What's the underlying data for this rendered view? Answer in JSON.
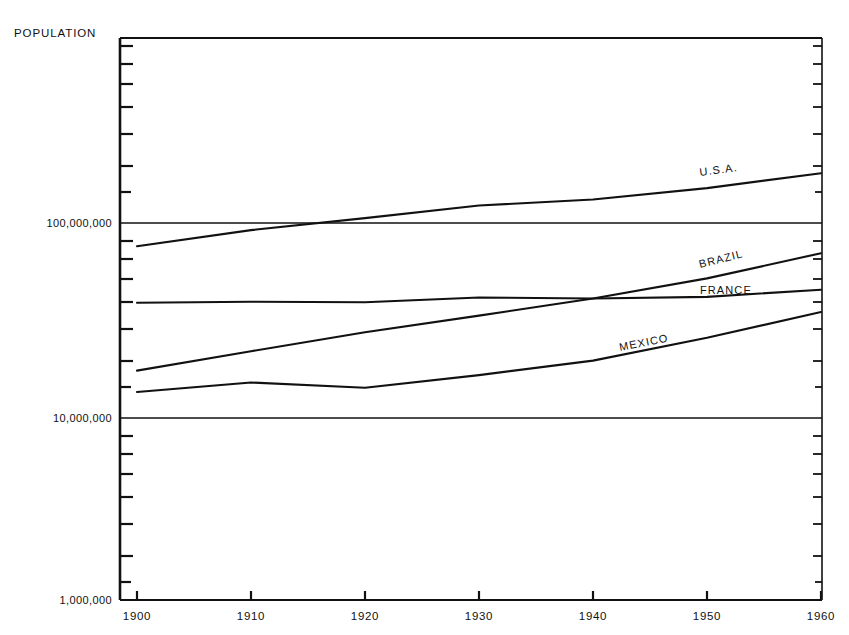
{
  "chart_data": {
    "type": "line",
    "title": "POPULATION",
    "xlabel": "",
    "ylabel": "POPULATION",
    "yscale": "log",
    "ylim": [
      1000000,
      250000000
    ],
    "xlim": [
      1897,
      1962
    ],
    "grid": true,
    "legend_position": "inline-labels",
    "x": [
      1900,
      1910,
      1920,
      1930,
      1940,
      1950,
      1960
    ],
    "xticklabels": [
      "1900",
      "1910",
      "1920",
      "1930",
      "1940",
      "1950",
      "1960"
    ],
    "yticks": [
      1000000,
      10000000,
      100000000
    ],
    "yticklabels": [
      "1,000,000",
      "10,000,000",
      "100,000,000"
    ],
    "series": [
      {
        "name": "U.S.A.",
        "label": "U.S.A.",
        "x": [
          1900,
          1910,
          1920,
          1930,
          1940,
          1950,
          1960
        ],
        "values": [
          76000000,
          92000000,
          106000000,
          123000000,
          132000000,
          151000000,
          180000000
        ]
      },
      {
        "name": "BRAZIL",
        "label": "BRAZIL",
        "x": [
          1900,
          1910,
          1920,
          1930,
          1940,
          1950,
          1960
        ],
        "values": [
          17500000,
          22000000,
          27500000,
          33500000,
          41000000,
          52000000,
          70000000
        ]
      },
      {
        "name": "FRANCE",
        "label": "FRANCE",
        "x": [
          1900,
          1910,
          1920,
          1930,
          1940,
          1950,
          1960
        ],
        "values": [
          39000000,
          39500000,
          39200000,
          41500000,
          41000000,
          41800000,
          45500000
        ]
      },
      {
        "name": "MEXICO",
        "label": "MEXICO",
        "x": [
          1900,
          1910,
          1920,
          1930,
          1940,
          1950,
          1960
        ],
        "values": [
          13600000,
          15200000,
          14300000,
          16600000,
          19700000,
          25800000,
          34900000
        ]
      }
    ]
  },
  "axes": {
    "y_title": "POPULATION",
    "y_labels": {
      "top": "100,000,000",
      "middle": "10,000,000",
      "bottom": "1,000,000"
    },
    "x_labels": [
      "1900",
      "1910",
      "1920",
      "1930",
      "1940",
      "1950",
      "1960"
    ]
  },
  "series_labels": {
    "usa": "U.S.A.",
    "brazil": "BRAZIL",
    "france": "FRANCE",
    "mexico": "MEXICO"
  },
  "colors": {
    "ink": "#111111",
    "background": "#ffffff"
  }
}
